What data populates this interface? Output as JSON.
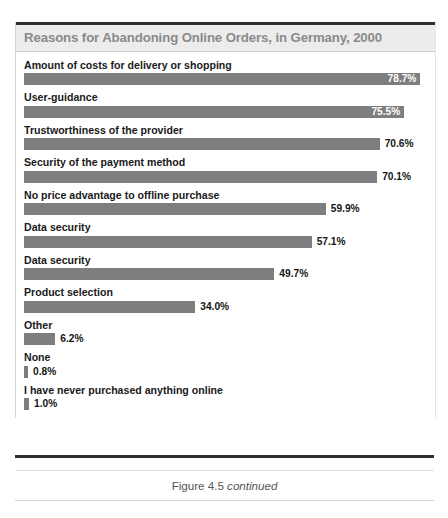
{
  "figure": {
    "title": "Reasons for Abandoning Online Orders, in Germany, 2000",
    "caption_prefix": "Figure 4.5",
    "caption_suffix": "continued",
    "bar_color": "#7e7e7e",
    "title_band_color": "#ececec",
    "title_text_color": "#8a8a8a"
  },
  "chart_data": {
    "type": "bar",
    "orientation": "horizontal",
    "title": "Reasons for Abandoning Online Orders, in Germany, 2000",
    "xlabel": "",
    "ylabel": "",
    "xlim": [
      0,
      80
    ],
    "grid": false,
    "legend": null,
    "value_suffix": "%",
    "categories": [
      "Amount of costs for delivery or shopping",
      "User-guidance",
      "Trustworthiness of the provider",
      "Security of the payment method",
      "No price advantage to offline purchase",
      "Data security",
      "Data security",
      "Product selection",
      "Other",
      "None",
      "I have never purchased anything online"
    ],
    "values": [
      78.7,
      75.5,
      70.6,
      70.1,
      59.9,
      57.1,
      49.7,
      34.0,
      6.2,
      0.8,
      1.0
    ],
    "value_labels": [
      "78.7%",
      "75.5%",
      "70.6%",
      "70.1%",
      "59.9%",
      "57.1%",
      "49.7%",
      "34.0%",
      "6.2%",
      "0.8%",
      "1.0%"
    ],
    "label_placement": [
      "inside",
      "inside",
      "outside",
      "outside",
      "outside",
      "outside",
      "outside",
      "outside",
      "outside",
      "outside",
      "outside"
    ]
  }
}
